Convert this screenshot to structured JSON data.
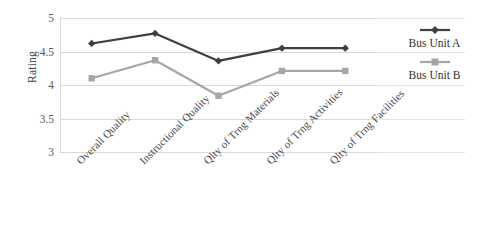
{
  "chart_data": {
    "type": "line",
    "title": "",
    "xlabel": "",
    "ylabel": "Rating",
    "ylim": [
      3,
      5
    ],
    "ytick_step": 0.5,
    "yticks": [
      "5",
      "4.5",
      "4",
      "3.5",
      "3"
    ],
    "grid": true,
    "legend_position": "right",
    "categories": [
      "Overall Quality",
      "Instructional Quality",
      "Qlty of Trng Materials",
      "Qlty of Trng Activities",
      "Qlty of Trng Facilities"
    ],
    "series": [
      {
        "name": "Bus Unit A",
        "color": "#3f3f3f",
        "marker": "diamond",
        "values": [
          4.62,
          4.77,
          4.36,
          4.55,
          4.55
        ]
      },
      {
        "name": "Bus Unit B",
        "color": "#a6a6a6",
        "marker": "square",
        "values": [
          4.1,
          4.37,
          3.84,
          4.21,
          4.21
        ]
      }
    ]
  },
  "legend": {
    "entries": [
      {
        "label": "Bus Unit A"
      },
      {
        "label": "Bus Unit B"
      }
    ]
  },
  "colors": {
    "series_a": "#3f3f3f",
    "series_b": "#a6a6a6",
    "gridline": "#d9d9d9",
    "background": "#ffffff"
  }
}
